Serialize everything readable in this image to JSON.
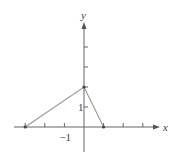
{
  "chart_data": {
    "type": "line",
    "title": "",
    "xlabel": "x",
    "ylabel": "y",
    "xlim": [
      -3,
      4
    ],
    "ylim": [
      -1,
      5
    ],
    "x_ticks": [
      -3,
      -2,
      -1,
      0,
      1,
      2,
      3
    ],
    "y_ticks": [
      1,
      2,
      3,
      4
    ],
    "x_tick_labels": [
      {
        "value": -1,
        "label": "−1"
      }
    ],
    "y_tick_labels": [
      {
        "value": 1,
        "label": "1"
      }
    ],
    "grid": false,
    "series": [
      {
        "name": "triangle-graph",
        "x": [
          -3,
          0,
          1
        ],
        "y": [
          0,
          2,
          0
        ]
      }
    ],
    "points": [
      {
        "x": -3,
        "y": 0
      },
      {
        "x": 0,
        "y": 2
      },
      {
        "x": 1,
        "y": 0
      }
    ]
  },
  "colors": {
    "axis": "#555555",
    "curve": "#999999"
  }
}
